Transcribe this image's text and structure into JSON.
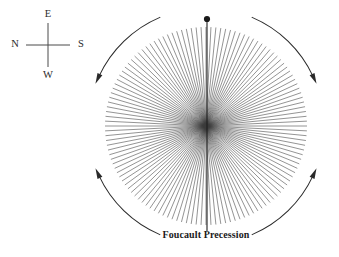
{
  "figure": {
    "caption": "Foucault Precession",
    "background_color": "#ffffff",
    "ink_color": "#2a2a2a"
  },
  "compass": {
    "name": "compass-rose",
    "center": {
      "x": 48,
      "y": 45
    },
    "arm_length": 22,
    "labels": {
      "top": "E",
      "bottom": "W",
      "left": "N",
      "right": "S"
    }
  },
  "starburst": {
    "name": "pendulum-swing-traces",
    "center": {
      "x": 206,
      "y": 126
    },
    "radius_x": 101,
    "radius_y": 99,
    "ray_count": 64,
    "ray_color": "#3a3a3a",
    "ray_width": 0.55,
    "description": "Successive swing planes of a Foucault pendulum tracing a rosette"
  },
  "pendulum": {
    "name": "pendulum-rod",
    "bob": {
      "x": 207,
      "y": 19,
      "radius": 3.1
    },
    "rod_top": {
      "x": 207,
      "y": 19
    },
    "rod_bottom": {
      "x": 207,
      "y": 231
    },
    "color": "#1e1e1e"
  },
  "precession_arrows": {
    "direction": "clockwise",
    "items": [
      {
        "name": "precession-arrow-top-left",
        "label": "top-left",
        "head_angle_deg": -55
      },
      {
        "name": "precession-arrow-top-right",
        "label": "top-right",
        "head_angle_deg": 125
      },
      {
        "name": "precession-arrow-bottom-right",
        "label": "bottom-right",
        "head_angle_deg": 215
      },
      {
        "name": "precession-arrow-bottom-left",
        "label": "bottom-left",
        "head_angle_deg": 305
      }
    ]
  },
  "chart_data": {
    "type": "line",
    "title": "Foucault Precession",
    "xlabel": "",
    "ylabel": "",
    "grid": false,
    "legend": "none",
    "annotations": [
      "E",
      "W",
      "N",
      "S"
    ],
    "series": [
      {
        "name": "swing-plane-traces",
        "description": "64 chords through the origin at evenly spaced angles, envelope is a near-circular ellipse of radii 101 x 99 px",
        "count": 64,
        "angle_step_deg": 5.625,
        "radius_x": 101,
        "radius_y": 99
      },
      {
        "name": "precession-direction-arcs",
        "description": "Four curved arrows outside the rosette indicating clockwise precession",
        "count": 4,
        "direction": "clockwise"
      }
    ]
  }
}
